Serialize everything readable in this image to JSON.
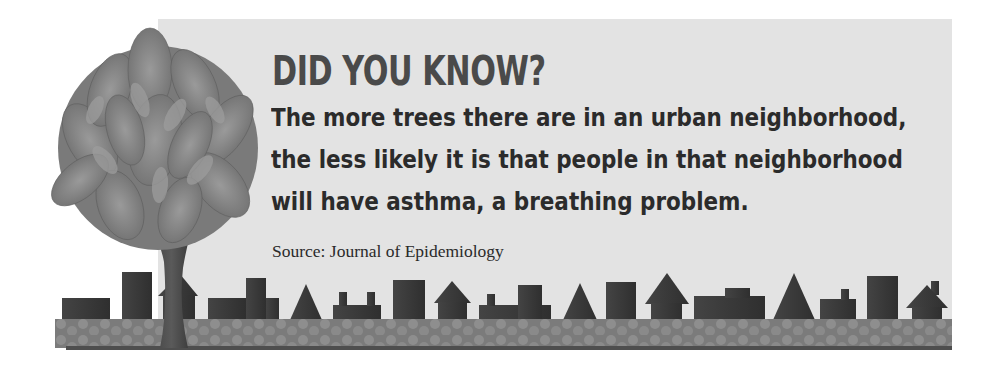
{
  "infographic": {
    "title": "DID YOU KNOW?",
    "body_lines": [
      "The more trees there are in an urban neighborhood,",
      "the less likely it is that people in that neighborhood",
      "will have asthma, a breathing problem."
    ],
    "source": "Source: Journal of Epidemiology"
  },
  "illustration": {
    "tree": "leafy-tree",
    "skyline": "city-skyline-silhouette",
    "ground": "patterned-ground-strip"
  },
  "colors": {
    "panel_bg": "#e3e3e3",
    "title": "#4a4a4a",
    "body_text": "#2b2b2b",
    "buildings": "#3a3a3a",
    "ground": "#7d7d7d",
    "foliage": "#8c8c8c"
  }
}
